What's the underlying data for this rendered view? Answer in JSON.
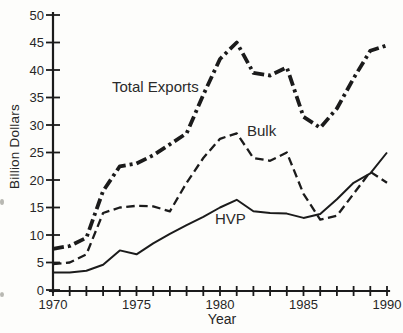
{
  "figure": {
    "background": "#fdfdfb",
    "ink": "#1b1b1b",
    "text_color": "#262626"
  },
  "chart_data": {
    "type": "line",
    "title": "",
    "xlabel": "Year",
    "ylabel": "Billion Dollars",
    "xlim": [
      1970,
      1990
    ],
    "ylim": [
      0,
      50
    ],
    "grid": false,
    "legend": "inline labels beside lines",
    "x": [
      1970,
      1971,
      1972,
      1973,
      1974,
      1975,
      1976,
      1977,
      1978,
      1979,
      1980,
      1981,
      1982,
      1983,
      1984,
      1985,
      1986,
      1987,
      1988,
      1989,
      1990
    ],
    "x_tick_years": [
      1970,
      1975,
      1980,
      1985,
      1990
    ],
    "x_tick_labels": [
      "1970",
      "1975",
      "1980",
      "1985",
      "1990"
    ],
    "y_ticks": [
      0,
      5,
      10,
      15,
      20,
      25,
      30,
      35,
      40,
      45,
      50
    ],
    "y_tick_labels": [
      "0",
      "5",
      "10",
      "15",
      "20",
      "25",
      "30",
      "35",
      "40",
      "45",
      "50"
    ],
    "series": [
      {
        "name": "Total Exports",
        "line_style": "dash-dot",
        "values": [
          7.5,
          8,
          9.5,
          18,
          22.5,
          23,
          24.5,
          26.5,
          28.5,
          35.5,
          42,
          45,
          39.5,
          39,
          40.5,
          31.5,
          29.5,
          33,
          38.5,
          43.5,
          44.5
        ]
      },
      {
        "name": "Bulk",
        "line_style": "dashed",
        "values": [
          4.7,
          5,
          6.5,
          14,
          15,
          15.3,
          15.2,
          14.3,
          19.5,
          24,
          27.5,
          28.5,
          24,
          23.5,
          25,
          17.5,
          12.8,
          13.5,
          17.5,
          21.5,
          19.5
        ]
      },
      {
        "name": "HVP",
        "line_style": "solid",
        "values": [
          3.2,
          3.2,
          3.5,
          4.6,
          7.2,
          6.5,
          8.5,
          10.2,
          11.8,
          13.3,
          15,
          16.4,
          14.3,
          14,
          13.9,
          13.1,
          13.8,
          16.5,
          19.5,
          21.2,
          25
        ]
      }
    ]
  }
}
